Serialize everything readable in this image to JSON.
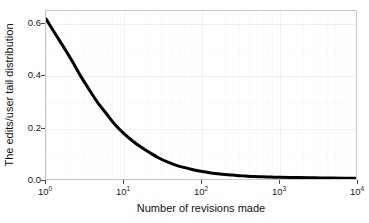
{
  "chart_data": {
    "type": "line",
    "title": "",
    "subtitle": "",
    "xlabel": "Number of revisions made",
    "ylabel": "The edits/user tail distribution",
    "xscale": "log",
    "yscale": "linear",
    "xlim": [
      1,
      10000
    ],
    "ylim": [
      0.0,
      0.65
    ],
    "grid": true,
    "legend": null,
    "xticks": [
      {
        "value": 1,
        "base": "10",
        "exponent": "0"
      },
      {
        "value": 10,
        "base": "10",
        "exponent": "1"
      },
      {
        "value": 100,
        "base": "10",
        "exponent": "2"
      },
      {
        "value": 1000,
        "base": "10",
        "exponent": "3"
      },
      {
        "value": 10000,
        "base": "10",
        "exponent": "4"
      }
    ],
    "yticks": [
      {
        "value": 0.0,
        "label": "0.0"
      },
      {
        "value": 0.2,
        "label": "0.2"
      },
      {
        "value": 0.4,
        "label": "0.4"
      },
      {
        "value": 0.6,
        "label": "0.6"
      }
    ],
    "series": [
      {
        "name": "edits/user tail distribution",
        "color": "#000000",
        "linewidth": 3,
        "x": [
          1,
          1.3,
          1.7,
          2.2,
          2.8,
          3.6,
          4.6,
          6.0,
          7.7,
          10,
          13,
          17,
          22,
          28,
          36,
          46,
          60,
          77,
          100,
          130,
          170,
          220,
          280,
          360,
          460,
          600,
          770,
          1000,
          1700,
          2800,
          4600,
          10000
        ],
        "y": [
          0.62,
          0.565,
          0.51,
          0.455,
          0.4,
          0.348,
          0.3,
          0.256,
          0.215,
          0.181,
          0.152,
          0.127,
          0.106,
          0.088,
          0.073,
          0.061,
          0.051,
          0.043,
          0.036,
          0.031,
          0.027,
          0.024,
          0.021,
          0.019,
          0.017,
          0.016,
          0.015,
          0.014,
          0.013,
          0.012,
          0.011,
          0.01
        ]
      }
    ]
  },
  "axes": {
    "frame_color": "#c9c9c9",
    "grid_color": "#f0f0f0",
    "background": "#ffffff"
  }
}
